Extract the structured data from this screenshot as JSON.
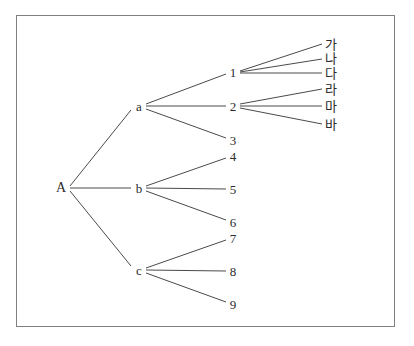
{
  "diagram": {
    "type": "tree",
    "orientation": "left-to-right",
    "background_color": "#ffffff",
    "frame_color": "#808080",
    "edge_color": "#4a4a4a",
    "text_color": "#2b2b2b",
    "nodes": [
      {
        "id": "A",
        "label": "A",
        "level": 0,
        "x": 61,
        "y": 188
      },
      {
        "id": "a",
        "label": "a",
        "level": 1,
        "x": 139,
        "y": 106
      },
      {
        "id": "b",
        "label": "b",
        "level": 1,
        "x": 139,
        "y": 188
      },
      {
        "id": "c",
        "label": "c",
        "level": 1,
        "x": 139,
        "y": 270
      },
      {
        "id": "n1",
        "label": "1",
        "level": 2,
        "x": 233,
        "y": 72
      },
      {
        "id": "n2",
        "label": "2",
        "level": 2,
        "x": 233,
        "y": 106
      },
      {
        "id": "n3",
        "label": "3",
        "level": 2,
        "x": 233,
        "y": 140
      },
      {
        "id": "n4",
        "label": "4",
        "level": 2,
        "x": 233,
        "y": 156
      },
      {
        "id": "n5",
        "label": "5",
        "level": 2,
        "x": 233,
        "y": 189
      },
      {
        "id": "n6",
        "label": "6",
        "level": 2,
        "x": 233,
        "y": 222
      },
      {
        "id": "n7",
        "label": "7",
        "level": 2,
        "x": 233,
        "y": 238
      },
      {
        "id": "n8",
        "label": "8",
        "level": 2,
        "x": 233,
        "y": 271
      },
      {
        "id": "n9",
        "label": "9",
        "level": 2,
        "x": 233,
        "y": 304
      },
      {
        "id": "k1",
        "label": "가",
        "level": 3,
        "x": 331,
        "y": 44
      },
      {
        "id": "k2",
        "label": "나",
        "level": 3,
        "x": 331,
        "y": 58
      },
      {
        "id": "k3",
        "label": "다",
        "level": 3,
        "x": 331,
        "y": 73
      },
      {
        "id": "k4",
        "label": "라",
        "level": 3,
        "x": 331,
        "y": 89
      },
      {
        "id": "k5",
        "label": "마",
        "level": 3,
        "x": 331,
        "y": 106
      },
      {
        "id": "k6",
        "label": "바",
        "level": 3,
        "x": 331,
        "y": 124
      }
    ],
    "edges": [
      {
        "from": "A",
        "to": "a",
        "x1": 70,
        "y1": 186,
        "x2": 131,
        "y2": 110
      },
      {
        "from": "A",
        "to": "b",
        "x1": 70,
        "y1": 188,
        "x2": 131,
        "y2": 188
      },
      {
        "from": "A",
        "to": "c",
        "x1": 70,
        "y1": 191,
        "x2": 131,
        "y2": 266
      },
      {
        "from": "a",
        "to": "n1",
        "x1": 146,
        "y1": 104,
        "x2": 226,
        "y2": 74
      },
      {
        "from": "a",
        "to": "n2",
        "x1": 146,
        "y1": 106,
        "x2": 226,
        "y2": 106
      },
      {
        "from": "a",
        "to": "n3",
        "x1": 146,
        "y1": 109,
        "x2": 226,
        "y2": 138
      },
      {
        "from": "b",
        "to": "n4",
        "x1": 146,
        "y1": 186,
        "x2": 226,
        "y2": 158
      },
      {
        "from": "b",
        "to": "n5",
        "x1": 146,
        "y1": 188,
        "x2": 226,
        "y2": 189
      },
      {
        "from": "b",
        "to": "n6",
        "x1": 146,
        "y1": 191,
        "x2": 226,
        "y2": 220
      },
      {
        "from": "c",
        "to": "n7",
        "x1": 146,
        "y1": 268,
        "x2": 226,
        "y2": 240
      },
      {
        "from": "c",
        "to": "n8",
        "x1": 146,
        "y1": 270,
        "x2": 226,
        "y2": 271
      },
      {
        "from": "c",
        "to": "n9",
        "x1": 146,
        "y1": 273,
        "x2": 226,
        "y2": 302
      },
      {
        "from": "n1",
        "to": "k1",
        "x1": 240,
        "y1": 71,
        "x2": 322,
        "y2": 44
      },
      {
        "from": "n1",
        "to": "k2",
        "x1": 240,
        "y1": 72,
        "x2": 322,
        "y2": 59
      },
      {
        "from": "n1",
        "to": "k3",
        "x1": 240,
        "y1": 73,
        "x2": 322,
        "y2": 73
      },
      {
        "from": "n2",
        "to": "k4",
        "x1": 240,
        "y1": 104,
        "x2": 322,
        "y2": 89
      },
      {
        "from": "n2",
        "to": "k5",
        "x1": 240,
        "y1": 106,
        "x2": 322,
        "y2": 106
      },
      {
        "from": "n2",
        "to": "k6",
        "x1": 240,
        "y1": 108,
        "x2": 322,
        "y2": 124
      }
    ]
  }
}
